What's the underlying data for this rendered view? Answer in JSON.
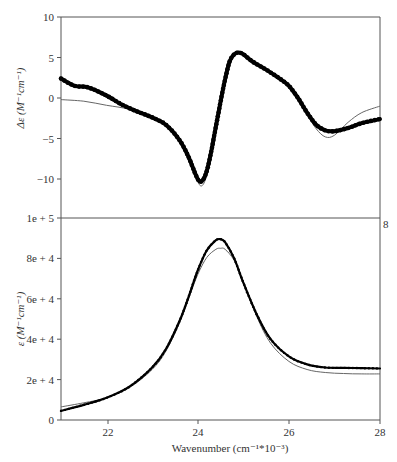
{
  "chart_data": [
    {
      "panel": "top",
      "type": "line",
      "title": "",
      "xlabel": "",
      "ylabel": "Δε (M⁻¹cm⁻¹)",
      "xlim": [
        21,
        28
      ],
      "ylim": [
        -10,
        10
      ],
      "yticks": [
        10,
        5,
        0,
        -5,
        -10
      ],
      "ytick_labels": [
        "10",
        "5",
        "0",
        "−5",
        "−10"
      ],
      "grid": false,
      "legend": null,
      "series": [
        {
          "name": "experimental",
          "style": "thick dotted",
          "x": [
            21.0,
            21.3,
            21.6,
            22.0,
            22.3,
            22.6,
            23.0,
            23.3,
            23.6,
            23.8,
            24.0,
            24.1,
            24.2,
            24.3,
            24.4,
            24.5,
            24.6,
            24.7,
            24.8,
            24.9,
            25.0,
            25.2,
            25.5,
            25.8,
            26.0,
            26.2,
            26.4,
            26.6,
            26.8,
            27.0,
            27.3,
            27.6,
            28.0
          ],
          "y": [
            2.4,
            1.5,
            1.3,
            0.3,
            -0.7,
            -1.5,
            -2.4,
            -3.3,
            -5.2,
            -7.3,
            -10.0,
            -10.2,
            -9.0,
            -6.5,
            -3.5,
            -0.5,
            2.3,
            4.5,
            5.4,
            5.6,
            5.4,
            4.5,
            3.5,
            2.4,
            1.5,
            0.0,
            -1.8,
            -3.3,
            -4.0,
            -4.1,
            -3.7,
            -3.1,
            -2.6
          ]
        },
        {
          "name": "fit",
          "style": "thin solid",
          "x": [
            21.0,
            21.5,
            22.0,
            22.5,
            23.0,
            23.3,
            23.6,
            23.8,
            24.0,
            24.1,
            24.2,
            24.3,
            24.4,
            24.5,
            24.6,
            24.7,
            24.8,
            24.9,
            25.0,
            25.2,
            25.5,
            25.8,
            26.0,
            26.2,
            26.4,
            26.6,
            26.8,
            27.0,
            27.3,
            27.6,
            28.0
          ],
          "y": [
            -0.2,
            -0.4,
            -0.9,
            -1.4,
            -2.4,
            -3.2,
            -5.0,
            -7.2,
            -10.3,
            -10.8,
            -9.5,
            -6.8,
            -3.5,
            -0.2,
            2.6,
            4.6,
            5.4,
            5.5,
            5.3,
            4.7,
            3.5,
            2.5,
            1.6,
            0.0,
            -2.0,
            -3.8,
            -4.8,
            -4.6,
            -3.0,
            -1.8,
            -1.0
          ]
        }
      ]
    },
    {
      "panel": "bottom",
      "type": "line",
      "title": "",
      "xlabel": "Wavenumber (cm⁻¹*10⁻³)",
      "ylabel": "ε (M⁻¹cm⁻¹)",
      "xlim": [
        21,
        28
      ],
      "ylim": [
        0,
        100000
      ],
      "xticks": [
        22,
        24,
        26,
        28
      ],
      "xtick_labels": [
        "22",
        "24",
        "26",
        "28"
      ],
      "yticks": [
        100000,
        80000,
        60000,
        40000,
        20000,
        0
      ],
      "ytick_labels": [
        "1e + 5",
        "8e + 4",
        "6e + 4",
        "4e + 4",
        "2e + 4",
        "0"
      ],
      "grid": false,
      "legend": null,
      "series": [
        {
          "name": "experimental",
          "style": "thick dotted",
          "x": [
            21.0,
            21.5,
            22.0,
            22.5,
            23.0,
            23.3,
            23.6,
            23.8,
            24.0,
            24.2,
            24.4,
            24.5,
            24.6,
            24.8,
            25.0,
            25.3,
            25.6,
            26.0,
            26.4,
            26.8,
            27.2,
            27.6,
            28.0
          ],
          "y": [
            4500,
            7500,
            11000,
            16500,
            26000,
            35000,
            49000,
            61000,
            74000,
            84000,
            89000,
            89500,
            88000,
            80000,
            68000,
            52000,
            40000,
            31500,
            27500,
            26000,
            25800,
            25700,
            25500
          ]
        },
        {
          "name": "fit",
          "style": "thin solid",
          "x": [
            21.0,
            21.5,
            22.0,
            22.5,
            23.0,
            23.3,
            23.6,
            23.8,
            24.0,
            24.2,
            24.4,
            24.5,
            24.6,
            24.8,
            25.0,
            25.3,
            25.6,
            26.0,
            26.4,
            26.8,
            27.2,
            27.6,
            28.0
          ],
          "y": [
            6500,
            8500,
            11000,
            16000,
            25000,
            34000,
            48000,
            60000,
            72000,
            80500,
            84500,
            85000,
            84500,
            79000,
            68500,
            51000,
            38000,
            29000,
            25000,
            23500,
            23000,
            22800,
            22800
          ]
        }
      ]
    }
  ],
  "top_panel": {
    "ylabel": "Δε (M⁻¹cm⁻¹)",
    "ytick_labels": [
      "10",
      "5",
      "0",
      "−5",
      "−10"
    ]
  },
  "bottom_panel": {
    "ylabel": "ε (M⁻¹cm⁻¹)",
    "ytick_labels": [
      "1e + 5",
      "8e + 4",
      "6e + 4",
      "4e + 4",
      "2e + 4",
      "0"
    ],
    "xtick_labels": [
      "22",
      "24",
      "26",
      "28"
    ],
    "xlabel": "Wavenumber (cm⁻¹*10⁻³)"
  },
  "stray_label": "8",
  "colors": {
    "axis": "#555555",
    "data": "#000000",
    "fit": "#555555"
  }
}
